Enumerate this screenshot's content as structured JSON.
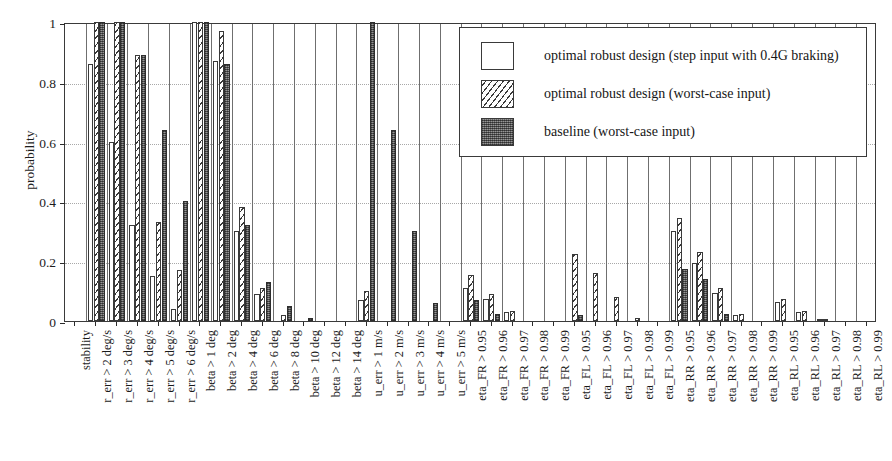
{
  "chart_data": {
    "type": "bar",
    "title": "",
    "xlabel": "",
    "ylabel": "probability",
    "ylim": [
      0,
      1
    ],
    "yticks": [
      0,
      0.2,
      0.4,
      0.6,
      0.8,
      1
    ],
    "ytick_labels": [
      "0",
      "0.2",
      "0.4",
      "0.6",
      "0.8",
      "1"
    ],
    "grid": "horizontal-dotted",
    "legend_position": "top-right",
    "orientation": "vertical-grouped",
    "xtick_rotation": 90,
    "categories": [
      "stability",
      "r_err > 2 deg/s",
      "r_err > 3 deg/s",
      "r_err > 4 deg/s",
      "r_err > 5 deg/s",
      "r_err > 6 deg/s",
      "beta > 1 deg",
      "beta > 2 deg",
      "beta > 4 deg",
      "beta > 6 deg",
      "beta > 8 deg",
      "beta > 10 deg",
      "beta > 12 deg",
      "beta > 14 deg",
      "u_err > 1 m/s",
      "u_err > 2 m/s",
      "u_err > 3 m/s",
      "u_err > 4 m/s",
      "u_err > 5 m/s",
      "eta_FR > 0.95",
      "eta_FR > 0.96",
      "eta_FR > 0.97",
      "eta_FR > 0.98",
      "eta_FR > 0.99",
      "eta_FL > 0.95",
      "eta_FL > 0.96",
      "eta_FL > 0.97",
      "eta_FL > 0.98",
      "eta_FL > 0.99",
      "eta_RR > 0.95",
      "eta_RR > 0.96",
      "eta_RR > 0.97",
      "eta_RR > 0.98",
      "eta_RR > 0.99",
      "eta_RL > 0.95",
      "eta_RL > 0.96",
      "eta_RL > 0.97",
      "eta_RL > 0.98",
      "eta_RL > 0.99"
    ],
    "series": [
      {
        "name": "optimal robust design (step input with 0.4G braking)",
        "fill": "white",
        "values": [
          0,
          0.86,
          0.6,
          0.32,
          0.15,
          0.04,
          1.0,
          0.87,
          0.3,
          0.09,
          0.0,
          0.0,
          0.0,
          0.0,
          0.07,
          0.0,
          0.0,
          0.0,
          0.0,
          0.11,
          0.075,
          0.03,
          0.0,
          0.0,
          0.0,
          0.0,
          0.0,
          0.0,
          0.0,
          0.3,
          0.195,
          0.095,
          0.02,
          0.0,
          0.065,
          0.03,
          0.005,
          0.0,
          0.0
        ]
      },
      {
        "name": "optimal robust design (worst-case input)",
        "fill": "hatched",
        "values": [
          0,
          1.0,
          1.0,
          0.89,
          0.33,
          0.17,
          1.0,
          0.97,
          0.38,
          0.11,
          0.02,
          0.0,
          0.0,
          0.0,
          0.1,
          0.0,
          0.0,
          0.0,
          0.0,
          0.155,
          0.09,
          0.035,
          0.0,
          0.0,
          0.225,
          0.16,
          0.08,
          0.01,
          0.0,
          0.345,
          0.23,
          0.11,
          0.025,
          0.0,
          0.075,
          0.035,
          0.005,
          0.0,
          0.0
        ]
      },
      {
        "name": "baseline (worst-case input)",
        "fill": "solid-dark",
        "values": [
          0,
          1.0,
          1.0,
          0.89,
          0.64,
          0.4,
          1.0,
          0.86,
          0.32,
          0.13,
          0.05,
          0.01,
          0.0,
          0.0,
          1.0,
          0.64,
          0.3,
          0.06,
          0.0,
          0.07,
          0.025,
          0.0,
          0.0,
          0.0,
          0.02,
          0.0,
          0.0,
          0.0,
          0.0,
          0.175,
          0.14,
          0.025,
          0.0,
          0.0,
          0.0,
          0.0,
          0.0,
          0.0,
          0.0
        ]
      }
    ]
  },
  "axis": {
    "ylabel": "probability"
  },
  "legend": {
    "items": [
      {
        "label": "optimal robust design (step input with 0.4G braking)",
        "style": "white"
      },
      {
        "label": "optimal robust design (worst-case input)",
        "style": "hatched"
      },
      {
        "label": "baseline (worst-case input)",
        "style": "solid-dark"
      }
    ]
  }
}
